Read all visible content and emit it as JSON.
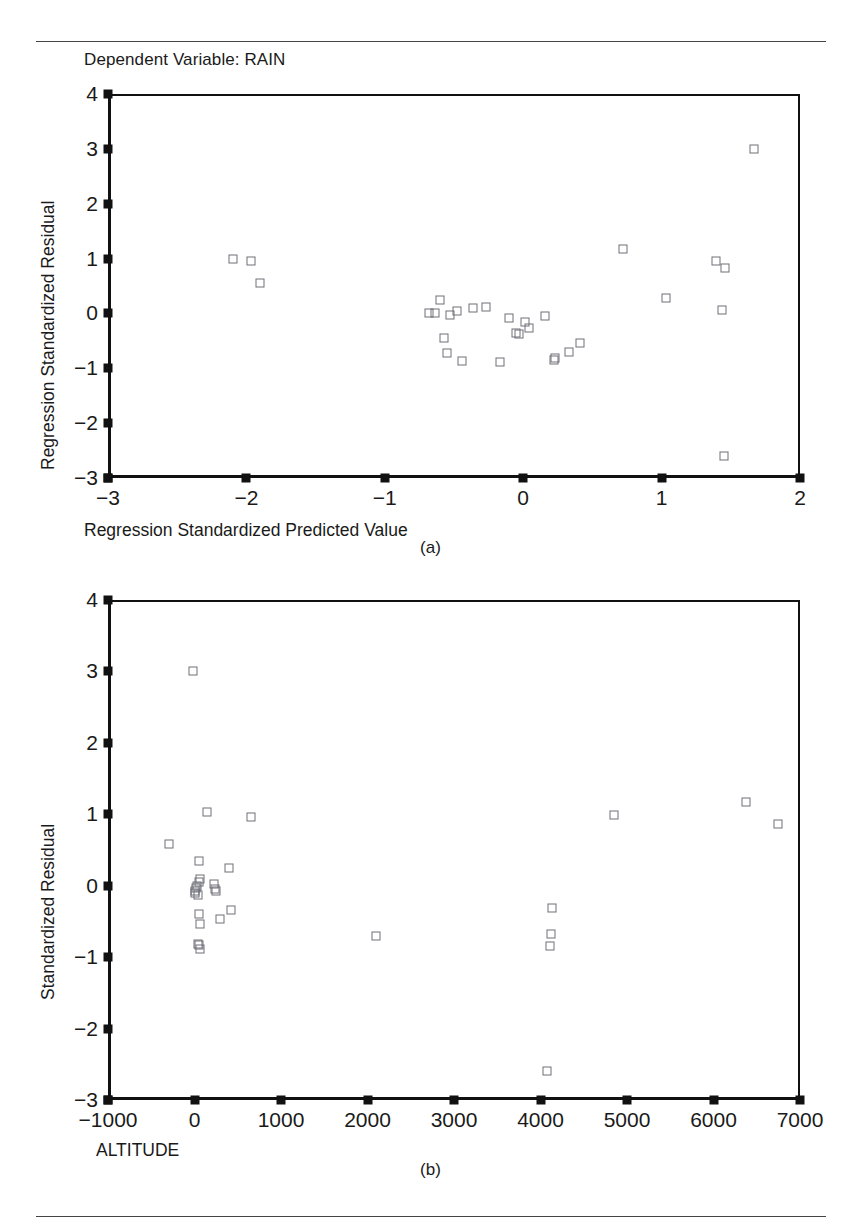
{
  "figure": {
    "panels": [
      {
        "id": "a",
        "caption": "(a)",
        "title": "Dependent Variable: RAIN"
      },
      {
        "id": "b",
        "caption": "(b)",
        "title": ""
      }
    ]
  },
  "chart_data": [
    {
      "type": "scatter",
      "panel": "(a)",
      "title": "Dependent Variable: RAIN",
      "xlabel": "Regression Standardized Predicted Value",
      "ylabel": "Regression Standardized Residual",
      "xlim": [
        -3,
        2
      ],
      "ylim": [
        -3,
        4
      ],
      "xticks": [
        -3,
        -2,
        -1,
        0,
        1,
        2
      ],
      "xticklabels": [
        "−3",
        "−2",
        "−1",
        "0",
        "1",
        "2"
      ],
      "yticks": [
        -3,
        -2,
        -1,
        0,
        1,
        2,
        3,
        4
      ],
      "yticklabels": [
        "−3",
        "−2",
        "−1",
        "0",
        "1",
        "2",
        "3",
        "4"
      ],
      "grid": false,
      "legend": null,
      "marker": "open-square",
      "marker_color": "#6e6e78",
      "points": [
        [
          -2.1,
          1.0
        ],
        [
          -1.97,
          0.95
        ],
        [
          -1.9,
          0.56
        ],
        [
          -0.68,
          0.0
        ],
        [
          -0.64,
          0.0
        ],
        [
          -0.6,
          0.25
        ],
        [
          -0.57,
          -0.44
        ],
        [
          -0.55,
          -0.72
        ],
        [
          -0.53,
          -0.02
        ],
        [
          -0.48,
          0.05
        ],
        [
          -0.44,
          -0.87
        ],
        [
          -0.36,
          0.09
        ],
        [
          -0.27,
          0.11
        ],
        [
          -0.17,
          -0.88
        ],
        [
          -0.1,
          -0.08
        ],
        [
          -0.05,
          -0.35
        ],
        [
          -0.03,
          -0.38
        ],
        [
          0.01,
          -0.15
        ],
        [
          0.04,
          -0.26
        ],
        [
          0.16,
          -0.05
        ],
        [
          0.22,
          -0.84
        ],
        [
          0.23,
          -0.82
        ],
        [
          0.33,
          -0.7
        ],
        [
          0.41,
          -0.54
        ],
        [
          0.72,
          1.17
        ],
        [
          1.03,
          0.28
        ],
        [
          1.39,
          0.96
        ],
        [
          1.44,
          0.07
        ],
        [
          1.46,
          0.83
        ],
        [
          1.45,
          -2.6
        ],
        [
          1.67,
          2.99
        ]
      ]
    },
    {
      "type": "scatter",
      "panel": "(b)",
      "title": "",
      "xlabel": "ALTITUDE",
      "ylabel": "Standardized Residual",
      "xlim": [
        -1000,
        7000
      ],
      "ylim": [
        -3,
        4
      ],
      "xticks": [
        -1000,
        0,
        1000,
        2000,
        3000,
        4000,
        5000,
        6000,
        7000
      ],
      "xticklabels": [
        "−1000",
        "0",
        "1000",
        "2000",
        "3000",
        "4000",
        "5000",
        "6000",
        "7000"
      ],
      "yticks": [
        -3,
        -2,
        -1,
        0,
        1,
        2,
        3,
        4
      ],
      "yticklabels": [
        "−3",
        "−2",
        "−1",
        "0",
        "1",
        "2",
        "3",
        "4"
      ],
      "grid": false,
      "legend": null,
      "marker": "open-square",
      "marker_color": "#6e6e78",
      "points": [
        [
          -20,
          3.0
        ],
        [
          -300,
          0.59
        ],
        [
          150,
          1.03
        ],
        [
          650,
          0.96
        ],
        [
          50,
          0.35
        ],
        [
          400,
          0.25
        ],
        [
          60,
          0.09
        ],
        [
          50,
          0.05
        ],
        [
          30,
          0.0
        ],
        [
          20,
          -0.03
        ],
        [
          10,
          -0.07
        ],
        [
          0,
          -0.1
        ],
        [
          40,
          -0.13
        ],
        [
          230,
          0.02
        ],
        [
          240,
          -0.04
        ],
        [
          250,
          -0.07
        ],
        [
          50,
          -0.4
        ],
        [
          60,
          -0.54
        ],
        [
          300,
          -0.46
        ],
        [
          420,
          -0.34
        ],
        [
          40,
          -0.82
        ],
        [
          55,
          -0.83
        ],
        [
          60,
          -0.88
        ],
        [
          2100,
          -0.7
        ],
        [
          4130,
          -0.31
        ],
        [
          4120,
          -0.67
        ],
        [
          4110,
          -0.84
        ],
        [
          4070,
          -2.6
        ],
        [
          4850,
          0.99
        ],
        [
          6370,
          1.17
        ],
        [
          6750,
          0.87
        ]
      ]
    }
  ]
}
